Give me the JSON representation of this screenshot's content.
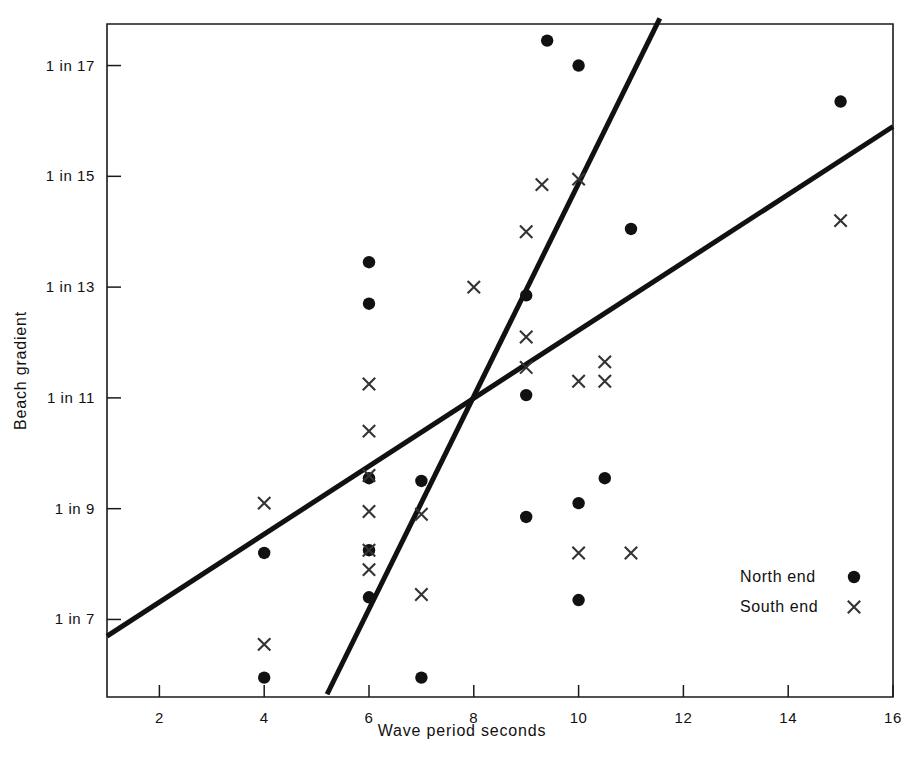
{
  "chart_data": {
    "type": "scatter",
    "title": "",
    "xlabel": "Wave period seconds",
    "ylabel": "Beach gradient",
    "xlim": [
      1,
      16
    ],
    "ylim": [
      5.6,
      17.75
    ],
    "grid": false,
    "xticks": [
      2,
      4,
      6,
      8,
      10,
      12,
      14,
      16
    ],
    "xtick_labels": [
      "2",
      "4",
      "6",
      "8",
      "10",
      "12",
      "14",
      "16"
    ],
    "yticks": [
      7,
      9,
      11,
      13,
      15,
      17
    ],
    "ytick_labels": [
      "1 in 7",
      "1 in 9",
      "1 in 11",
      "1 in 13",
      "1 in 15",
      "1 in 17"
    ],
    "legend_position": "bottom-right",
    "legend": [
      {
        "name": "North end",
        "marker": "circle"
      },
      {
        "name": "South end",
        "marker": "cross"
      }
    ],
    "series": [
      {
        "name": "North end",
        "marker": "circle",
        "points": [
          [
            4.0,
            8.2
          ],
          [
            4.0,
            5.95
          ],
          [
            6.0,
            13.45
          ],
          [
            6.0,
            12.7
          ],
          [
            6.0,
            9.55
          ],
          [
            6.0,
            8.25
          ],
          [
            6.0,
            7.4
          ],
          [
            7.0,
            9.5
          ],
          [
            7.0,
            5.95
          ],
          [
            9.0,
            12.85
          ],
          [
            9.0,
            11.05
          ],
          [
            9.0,
            8.85
          ],
          [
            9.4,
            17.45
          ],
          [
            10.0,
            17.0
          ],
          [
            10.0,
            9.1
          ],
          [
            10.0,
            7.35
          ],
          [
            10.5,
            9.55
          ],
          [
            11.0,
            14.05
          ],
          [
            15.0,
            16.35
          ]
        ]
      },
      {
        "name": "South end",
        "marker": "cross",
        "points": [
          [
            4.0,
            9.1
          ],
          [
            4.0,
            6.55
          ],
          [
            6.0,
            11.25
          ],
          [
            6.0,
            10.4
          ],
          [
            6.0,
            9.6
          ],
          [
            6.0,
            8.95
          ],
          [
            6.0,
            8.25
          ],
          [
            6.0,
            7.9
          ],
          [
            7.0,
            8.9
          ],
          [
            7.0,
            7.45
          ],
          [
            8.0,
            13.0
          ],
          [
            9.0,
            14.0
          ],
          [
            9.0,
            12.1
          ],
          [
            9.0,
            11.55
          ],
          [
            9.3,
            14.85
          ],
          [
            10.0,
            14.95
          ],
          [
            10.0,
            11.3
          ],
          [
            10.5,
            11.65
          ],
          [
            10.5,
            11.3
          ],
          [
            10.0,
            8.2
          ],
          [
            11.0,
            8.2
          ],
          [
            15.0,
            14.2
          ]
        ]
      }
    ],
    "trend_lines": [
      {
        "name": "steep-trend-line",
        "x0": 5.2,
        "y0": 5.65,
        "x1": 11.55,
        "y1": 17.85
      },
      {
        "name": "shallow-trend-line",
        "x0": 1.0,
        "y0": 6.7,
        "x1": 16.0,
        "y1": 15.9
      }
    ]
  }
}
